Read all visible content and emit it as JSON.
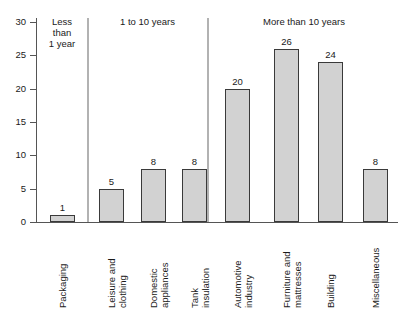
{
  "chart_data": {
    "type": "bar",
    "title": "",
    "subtitle": "",
    "xlabel": "",
    "ylabel": "",
    "ylim": [
      0,
      30
    ],
    "yticks": [
      0,
      5,
      10,
      15,
      20,
      25,
      30
    ],
    "ytick_labels": [
      "0",
      "5",
      "10",
      "15",
      "20",
      "25",
      "30"
    ],
    "grid": false,
    "legend": null,
    "categories": [
      "Packaging",
      "Leisure and clothing",
      "Domestic appliances",
      "Tank insulation",
      "Automotive industry",
      "Furniture and mattresses",
      "Building",
      "Miscellaneous"
    ],
    "values": [
      1,
      5,
      8,
      8,
      20,
      26,
      24,
      8
    ],
    "value_labels": [
      "1",
      "5",
      "8",
      "8",
      "20",
      "26",
      "24",
      "8"
    ],
    "bar_color": "#d2d2d2",
    "bar_edge_color": "#3a3a3a",
    "groups": [
      {
        "label": "Less\nthan\n1 year",
        "members": [
          "Packaging"
        ]
      },
      {
        "label": "1 to 10 years",
        "members": [
          "Leisure and clothing",
          "Domestic appliances",
          "Tank insulation"
        ]
      },
      {
        "label": "More than 10 years",
        "members": [
          "Automotive industry",
          "Furniture and mattresses",
          "Building",
          "Miscellaneous"
        ]
      }
    ]
  },
  "axis": {
    "ticks": [
      {
        "value": 30,
        "label": "30"
      },
      {
        "value": 25,
        "label": "25"
      },
      {
        "value": 20,
        "label": "20"
      },
      {
        "value": 15,
        "label": "15"
      },
      {
        "value": 10,
        "label": "10"
      },
      {
        "value": 5,
        "label": "5"
      },
      {
        "value": 0,
        "label": "0"
      }
    ]
  },
  "categories_display": [
    "Packaging",
    "Leisure and\nclothing",
    "Domestic\nappliances",
    "Tank\ninsulation",
    "Automotive\nindustry",
    "Furniture and\nmattresses",
    "Building",
    "Miscellaneous"
  ],
  "groups_display": [
    "Less\nthan\n1 year",
    "1 to 10 years",
    "More than 10 years"
  ]
}
